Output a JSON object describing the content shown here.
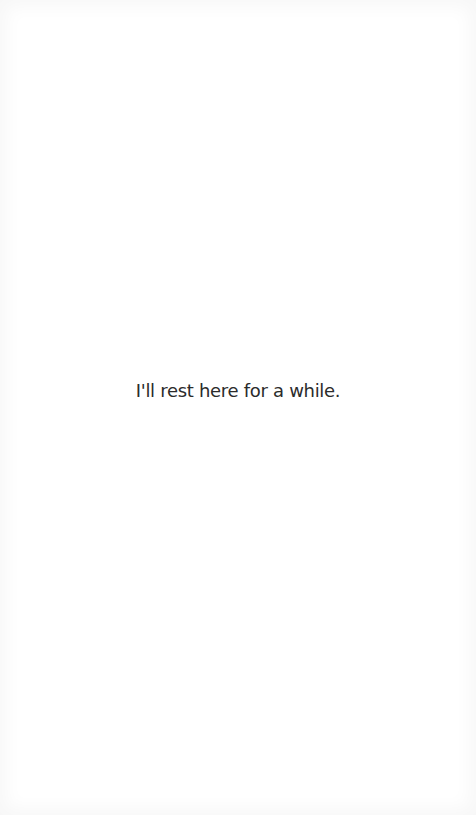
{
  "page": {
    "message": "I'll rest here for a while."
  },
  "colors": {
    "background": "#ffffff",
    "text": "#2b2b2b"
  }
}
